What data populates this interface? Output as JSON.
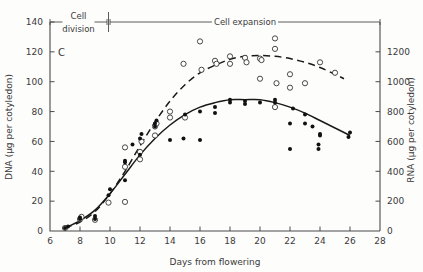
{
  "chart_data": {
    "type": "scatter",
    "title": "",
    "panel_label": "C",
    "xlabel": "Days from flowering",
    "ylabel": "DNA (µg per cotyledon)",
    "ylabel_right": "RNA (µg per cotyledon)",
    "xlim": [
      6,
      28
    ],
    "ylim": [
      0,
      140
    ],
    "ylim_right": [
      0,
      1400
    ],
    "xticks": [
      6,
      8,
      10,
      12,
      14,
      16,
      18,
      20,
      22,
      24,
      26,
      28
    ],
    "yticks": [
      0,
      20,
      40,
      60,
      80,
      100,
      120,
      140
    ],
    "yticks_right": [
      0,
      200,
      400,
      600,
      800,
      1000,
      1200
    ],
    "grid": false,
    "legend": "none",
    "annotations": [
      {
        "name": "cell-division",
        "text": "Cell division",
        "x_start": 6,
        "x_end": 9.8
      },
      {
        "name": "cell-expansion",
        "text": "Cell expansion",
        "x_start": 10.0,
        "x_end": 28
      }
    ],
    "series": [
      {
        "name": "DNA",
        "marker": "filled-circle",
        "line": "solid",
        "axis": "left",
        "points": [
          [
            7.0,
            2
          ],
          [
            7.2,
            3
          ],
          [
            8.0,
            8
          ],
          [
            8.0,
            9
          ],
          [
            9.0,
            8
          ],
          [
            9.0,
            10
          ],
          [
            9.9,
            24
          ],
          [
            10.0,
            28
          ],
          [
            11.0,
            34
          ],
          [
            11.0,
            46
          ],
          [
            11.0,
            47
          ],
          [
            11.5,
            58
          ],
          [
            12.0,
            51
          ],
          [
            12.0,
            62
          ],
          [
            12.1,
            65
          ],
          [
            13.0,
            70
          ],
          [
            13.0,
            72
          ],
          [
            13.1,
            74
          ],
          [
            14.0,
            61
          ],
          [
            14.9,
            62
          ],
          [
            16.0,
            61
          ],
          [
            15.0,
            78
          ],
          [
            16.0,
            80
          ],
          [
            17.0,
            79
          ],
          [
            17.0,
            83
          ],
          [
            18.0,
            86
          ],
          [
            18.0,
            88
          ],
          [
            19.0,
            85
          ],
          [
            19.0,
            87
          ],
          [
            20.0,
            86
          ],
          [
            21.0,
            88
          ],
          [
            21.0,
            86
          ],
          [
            22.0,
            72
          ],
          [
            22.0,
            55
          ],
          [
            23.0,
            72
          ],
          [
            23.5,
            70
          ],
          [
            23.9,
            55
          ],
          [
            23.9,
            58
          ],
          [
            24.0,
            64
          ],
          [
            24.0,
            65
          ],
          [
            22.2,
            82
          ],
          [
            23.0,
            78
          ],
          [
            25.9,
            63
          ],
          [
            26.0,
            66
          ]
        ]
      },
      {
        "name": "RNA",
        "marker": "open-circle",
        "line": "dashed",
        "axis": "right",
        "points": [
          [
            7.0,
            20
          ],
          [
            8.0,
            80
          ],
          [
            8.1,
            95
          ],
          [
            9.0,
            75
          ],
          [
            9.9,
            190
          ],
          [
            11.0,
            195
          ],
          [
            11.0,
            430
          ],
          [
            11.0,
            560
          ],
          [
            12.0,
            480
          ],
          [
            12.0,
            530
          ],
          [
            12.1,
            600
          ],
          [
            13.0,
            640
          ],
          [
            13.0,
            700
          ],
          [
            13.1,
            720
          ],
          [
            14.0,
            760
          ],
          [
            14.0,
            800
          ],
          [
            15.0,
            760
          ],
          [
            14.9,
            1120
          ],
          [
            16.0,
            1270
          ],
          [
            16.1,
            1080
          ],
          [
            17.0,
            1140
          ],
          [
            17.1,
            1120
          ],
          [
            18.0,
            1170
          ],
          [
            18.0,
            1120
          ],
          [
            19.0,
            1160
          ],
          [
            19.1,
            1130
          ],
          [
            20.0,
            1155
          ],
          [
            20.1,
            1145
          ],
          [
            21.0,
            1290
          ],
          [
            21.0,
            1220
          ],
          [
            20.0,
            1020
          ],
          [
            21.1,
            990
          ],
          [
            22.0,
            1050
          ],
          [
            22.0,
            960
          ],
          [
            23.0,
            990
          ],
          [
            21.0,
            830
          ],
          [
            24.0,
            1130
          ],
          [
            25.0,
            1060
          ]
        ]
      }
    ],
    "fit_curves": [
      {
        "name": "DNA-fit",
        "style": "solid",
        "axis": "left",
        "path": [
          [
            7.0,
            2
          ],
          [
            8.0,
            7
          ],
          [
            9.0,
            14
          ],
          [
            10.0,
            25
          ],
          [
            11.0,
            38
          ],
          [
            12.0,
            51
          ],
          [
            13.0,
            62
          ],
          [
            14.0,
            71
          ],
          [
            15.0,
            78
          ],
          [
            16.0,
            83
          ],
          [
            17.0,
            86
          ],
          [
            18.0,
            88
          ],
          [
            19.0,
            88
          ],
          [
            20.0,
            88
          ],
          [
            21.0,
            86
          ],
          [
            22.0,
            83
          ],
          [
            23.0,
            79
          ],
          [
            24.0,
            74
          ],
          [
            25.0,
            69
          ],
          [
            26.0,
            64
          ]
        ]
      },
      {
        "name": "RNA-fit",
        "style": "dashed",
        "axis": "right",
        "path": [
          [
            7.0,
            20
          ],
          [
            8.0,
            60
          ],
          [
            9.0,
            130
          ],
          [
            10.0,
            250
          ],
          [
            11.0,
            400
          ],
          [
            12.0,
            570
          ],
          [
            13.0,
            730
          ],
          [
            14.0,
            870
          ],
          [
            15.0,
            980
          ],
          [
            16.0,
            1060
          ],
          [
            17.0,
            1110
          ],
          [
            18.0,
            1150
          ],
          [
            19.0,
            1170
          ],
          [
            20.0,
            1175
          ],
          [
            21.0,
            1170
          ],
          [
            22.0,
            1155
          ],
          [
            23.0,
            1130
          ],
          [
            24.0,
            1095
          ],
          [
            25.0,
            1050
          ],
          [
            25.6,
            1020
          ]
        ]
      }
    ]
  },
  "figure": {
    "x_axis_title": "Days from flowering",
    "y_axis_left_title": "DNA (µg per cotyledon)",
    "y_axis_right_title": "RNA (µg per cotyledon)",
    "panel_label": "C",
    "phase_division": "Cell division",
    "phase_expansion": "Cell expansion"
  }
}
